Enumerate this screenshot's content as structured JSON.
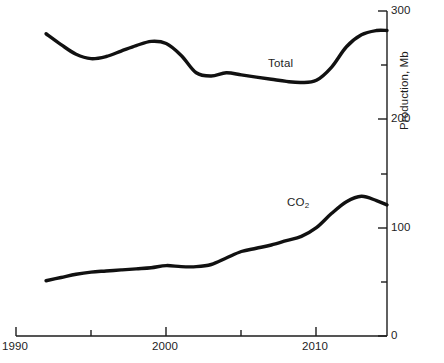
{
  "chart_data": {
    "type": "line",
    "title": "",
    "subtitle": "",
    "xlabel": "",
    "ylabel": "Production, Mb",
    "xlim": [
      1990,
      2014.7
    ],
    "ylim": [
      0,
      300
    ],
    "grid": false,
    "legend_position": "inline-annotations",
    "x_major_ticks": [
      1990,
      2000,
      2010
    ],
    "x_major_tick_labels": [
      "1990",
      "2000",
      "2010"
    ],
    "x_minor_ticks": [
      1995,
      2005
    ],
    "y_major_ticks": [
      0,
      100,
      200,
      300
    ],
    "y_major_tick_labels": [
      "0",
      "100",
      "200",
      "300"
    ],
    "y_minor_ticks": [
      50,
      150,
      250
    ],
    "y_axis_side": "right",
    "annotations": [
      {
        "text": "Total",
        "x": 2007.0,
        "y": 252
      },
      {
        "text": "CO",
        "sub": "2",
        "x": 2004.0,
        "y": 132
      }
    ],
    "series": [
      {
        "name": "Total",
        "label": "Total",
        "color": "#111111",
        "x": [
          1992.0,
          1993.0,
          1994.0,
          1995.0,
          1996.0,
          1997.0,
          1998.0,
          1999.0,
          2000.0,
          2001.0,
          2002.0,
          2003.0,
          2004.0,
          2005.0,
          2006.0,
          2007.0,
          2008.0,
          2009.0,
          2010.0,
          2011.0,
          2012.0,
          2013.0,
          2014.0,
          2014.7
        ],
        "values": [
          279,
          269,
          260,
          256,
          258,
          263,
          268,
          272,
          270,
          259,
          243,
          240,
          243,
          241,
          239,
          237,
          235,
          234,
          236,
          248,
          267,
          278,
          282,
          282
        ]
      },
      {
        "name": "CO2",
        "label": "CO2",
        "color": "#111111",
        "x": [
          1992.0,
          1993.0,
          1994.0,
          1995.0,
          1996.0,
          1997.0,
          1998.0,
          1999.0,
          2000.0,
          2001.0,
          2002.0,
          2003.0,
          2004.0,
          2005.0,
          2006.0,
          2007.0,
          2008.0,
          2009.0,
          2010.0,
          2011.0,
          2012.0,
          2013.0,
          2014.0,
          2014.7
        ],
        "values": [
          51,
          54,
          57,
          59,
          60,
          61,
          62,
          63,
          65,
          64,
          64,
          66,
          72,
          78,
          81,
          84,
          88,
          92,
          100,
          113,
          124,
          129,
          125,
          121
        ]
      }
    ]
  },
  "axes": {
    "y_title": "Production, Mb",
    "y_labels": [
      "300",
      "200",
      "100",
      "0"
    ],
    "x_labels": [
      "1990",
      "2000",
      "2010"
    ]
  },
  "caption": {
    "text": ""
  }
}
